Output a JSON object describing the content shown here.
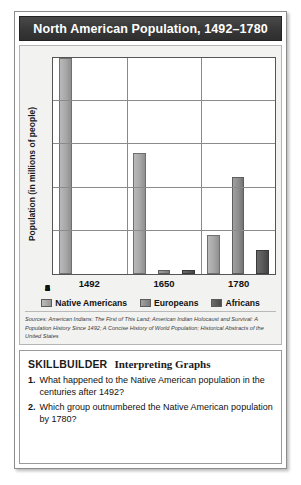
{
  "title": "North American Population, 1492–1780",
  "chart_data": {
    "type": "bar",
    "title": "North American Population, 1492–1780",
    "xlabel": "",
    "ylabel": "Population (in millions of people)",
    "categories": [
      "1492",
      "1650",
      "1780"
    ],
    "series": [
      {
        "name": "Native Americans",
        "values": [
          5.0,
          2.8,
          0.9
        ],
        "color": "#a7a7a7"
      },
      {
        "name": "Europeans",
        "values": [
          0,
          0.1,
          2.25
        ],
        "color": "#8d8d8d"
      },
      {
        "name": "Africans",
        "values": [
          0,
          0.1,
          0.55
        ],
        "color": "#585858"
      }
    ],
    "ylim": [
      0,
      5
    ],
    "yticks": [
      "0",
      "1",
      "2",
      "3",
      "4",
      "5"
    ],
    "grid": true,
    "legend_position": "bottom"
  },
  "sources": "Sources: American Indians: The First of This Land; American Indian Holocaust and Survival: A Population History Since 1492; A Concise History of World Population; Historical Abstracts of the United States",
  "skillbuilder": {
    "label": "SKILLBUILDER",
    "subtitle": "Interpreting Graphs",
    "questions": [
      {
        "number": "1.",
        "text": "What happened to the Native American population in the centuries after 1492?"
      },
      {
        "number": "2.",
        "text": "Which group outnumbered the Native American population by 1780?"
      }
    ]
  }
}
